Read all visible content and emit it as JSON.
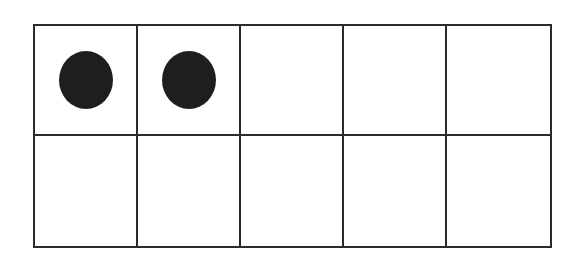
{
  "diagram": {
    "type": "ten-frame",
    "rows": 2,
    "columns": 5,
    "filled_count": 2,
    "cells": [
      {
        "row": 1,
        "col": 1,
        "filled": true
      },
      {
        "row": 1,
        "col": 2,
        "filled": true
      },
      {
        "row": 1,
        "col": 3,
        "filled": false
      },
      {
        "row": 1,
        "col": 4,
        "filled": false
      },
      {
        "row": 1,
        "col": 5,
        "filled": false
      },
      {
        "row": 2,
        "col": 1,
        "filled": false
      },
      {
        "row": 2,
        "col": 2,
        "filled": false
      },
      {
        "row": 2,
        "col": 3,
        "filled": false
      },
      {
        "row": 2,
        "col": 4,
        "filled": false
      },
      {
        "row": 2,
        "col": 5,
        "filled": false
      }
    ],
    "colors": {
      "grid_line": "#2b2b2b",
      "counter": "#1e1e1e",
      "background": "#ffffff"
    }
  }
}
